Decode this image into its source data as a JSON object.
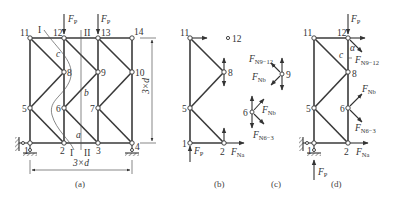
{
  "figure": {
    "panels": [
      {
        "id": "a",
        "caption": "(a)"
      },
      {
        "id": "b",
        "caption": "(b)"
      },
      {
        "id": "c",
        "caption": "(c)"
      },
      {
        "id": "d",
        "caption": "(d)"
      }
    ]
  },
  "panel_a": {
    "caption": "(a)",
    "nodes": [
      "1",
      "2",
      "3",
      "4",
      "5",
      "6",
      "7",
      "8",
      "9",
      "10",
      "11",
      "12",
      "13",
      "14"
    ],
    "load_label": "F",
    "load_sub": "P",
    "section_I": "I",
    "section_II": "II",
    "point_a": "a",
    "point_b": "b",
    "point_c": "c",
    "dim_height": "3×d",
    "dim_width": "3×d"
  },
  "panel_b": {
    "caption": "(b)",
    "nodes": [
      "11",
      "12",
      "8",
      "5",
      "1",
      "2"
    ],
    "force_FP": "F",
    "force_FP_sub": "P",
    "force_FNa": "F",
    "force_FNa_sub": "Na"
  },
  "panel_c": {
    "caption": "(c)",
    "node_9": "9",
    "node_6": "6",
    "force_FN9_12": "F",
    "force_FN9_12_sub": "N9−12",
    "force_FNb_top": "F",
    "force_FNb_top_sub": "Nb",
    "force_FNb_bot": "F",
    "force_FNb_bot_sub": "Nb",
    "force_FN6_3": "F",
    "force_FN6_3_sub": "N6−3"
  },
  "panel_d": {
    "caption": "(d)",
    "nodes": [
      "11",
      "12",
      "8",
      "5",
      "6",
      "1",
      "2"
    ],
    "force_FP_top": "F",
    "force_FP_top_sub": "P",
    "force_FN9_12": "F",
    "force_FN9_12_sub": "N9−12",
    "force_FNb": "F",
    "force_FNb_sub": "Nb",
    "force_FN6_3": "F",
    "force_FN6_3_sub": "N6−3",
    "force_FNa": "F",
    "force_FNa_sub": "Na",
    "force_FP_bot": "F",
    "force_FP_bot_sub": "P",
    "angle_alpha": "α",
    "point_c": "c"
  }
}
